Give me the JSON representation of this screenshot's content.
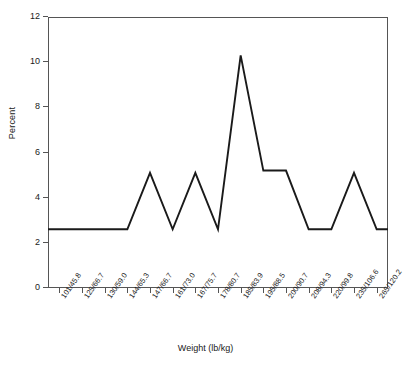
{
  "chart_data": {
    "type": "line",
    "title": "",
    "xlabel": "Weight (lb/kg)",
    "ylabel": "Percent",
    "ylim": [
      0,
      12
    ],
    "yticks": [
      0,
      2,
      4,
      6,
      8,
      10,
      12
    ],
    "grid": false,
    "legend": null,
    "categories": [
      "101/45.8",
      "125/66.7",
      "130/59.0",
      "144/65.3",
      "147/66.7",
      "161/73.0",
      "167/75.7",
      "178/80.7",
      "185/83.9",
      "195/88.5",
      "200/90.7",
      "208/94.3",
      "220/99.8",
      "235/106.6",
      "265/120.2"
    ],
    "values": [
      2.6,
      2.6,
      2.6,
      2.6,
      5.1,
      2.6,
      5.1,
      2.6,
      10.3,
      5.2,
      5.2,
      2.6,
      2.6,
      5.1,
      2.6
    ],
    "series_color": "#1a1a1a",
    "axis_color": "#555555"
  },
  "axes": {
    "y_label": "Percent",
    "x_label": "Weight (lb/kg)",
    "y_tick_labels": [
      "0",
      "2",
      "4",
      "6",
      "8",
      "10",
      "12"
    ],
    "x_tick_labels": [
      "101/45.8",
      "125/66.7",
      "130/59.0",
      "144/65.3",
      "147/66.7",
      "161/73.0",
      "167/75.7",
      "178/80.7",
      "185/83.9",
      "195/88.5",
      "200/90.7",
      "208/94.3",
      "220/99.8",
      "235/106.6",
      "265/120.2"
    ]
  }
}
